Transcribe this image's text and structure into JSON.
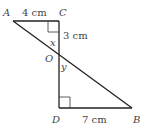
{
  "diagram": {
    "points": {
      "A": {
        "label": "A",
        "x": 13,
        "y": 21
      },
      "C": {
        "label": "C",
        "x": 59,
        "y": 21
      },
      "O": {
        "label": "O",
        "x": 59,
        "y": 53
      },
      "D": {
        "label": "D",
        "x": 59,
        "y": 108
      },
      "B": {
        "label": "B",
        "x": 132,
        "y": 108
      }
    },
    "measures": {
      "AC": "4 cm",
      "CO": "3 cm",
      "DB": "7 cm"
    },
    "angles": {
      "x": "x",
      "y": "y"
    },
    "line_color": "#222222",
    "label_color": "#444444"
  }
}
